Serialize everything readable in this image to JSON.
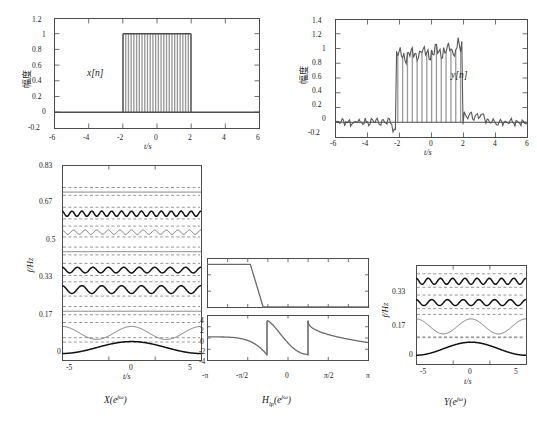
{
  "figure": {
    "background": "#ffffff",
    "line_color": "#4d4d4d",
    "dark_line_color": "#1a1a1a",
    "grid_color": "#808080"
  },
  "panels": {
    "top_left": {
      "name": "x[n] time-domain signal",
      "inner_label": "x[n]",
      "xlabel": "t/s",
      "ylabel": "幅度",
      "xticks": [
        "-6",
        "-4",
        "-2",
        "0",
        "2",
        "4",
        "6"
      ],
      "yticks": [
        "1.2",
        "1",
        "0.8",
        "0.6",
        "0.4",
        "0.2",
        "0",
        "-0.2"
      ],
      "xlim": [
        -6,
        6
      ],
      "ylim": [
        -0.2,
        1.2
      ]
    },
    "top_right": {
      "name": "y[n] time-domain signal",
      "inner_label": "y[n]",
      "xlabel": "t/s",
      "ylabel": "幅度",
      "xticks": [
        "-6",
        "-4",
        "-2",
        "0",
        "2",
        "4",
        "6"
      ],
      "yticks": [
        "1.4",
        "1.2",
        "1",
        "0.8",
        "0.6",
        "0.4",
        "0.2",
        "0",
        "-0.2"
      ],
      "xlim": [
        -6,
        6
      ],
      "ylim": [
        -0.2,
        1.4
      ]
    },
    "bottom_left": {
      "name": "X(e^jw) spectrogram waterfall",
      "caption": "X(eʲᵒ)",
      "caption_parts": {
        "base": "X(e",
        "sup": "jω",
        "close": ")"
      },
      "xlabel": "t/s",
      "ylabel": "f/Hz",
      "xticks": [
        "-5",
        "0",
        "5"
      ],
      "yticks": [
        "0.83",
        "0.67",
        "0.5",
        "0.33",
        "0.17",
        "0"
      ],
      "xlim": [
        -6,
        6
      ],
      "ylim": [
        0,
        0.9
      ]
    },
    "middle_mag": {
      "name": "Hlp magnitude response",
      "xticks": [],
      "ylim": [
        0,
        1.2
      ]
    },
    "middle_phase": {
      "name": "Hlp phase response",
      "caption": "H_lp(e^jw)",
      "caption_parts": {
        "base": "H",
        "sub": "lp",
        "mid": "(e",
        "sup": "jω",
        "close": ")"
      },
      "xticks": [
        "-π",
        "-π/2",
        "0",
        "π/2",
        "π"
      ],
      "yticks": [
        "4",
        "2",
        "0",
        "-2",
        "-4"
      ],
      "ylim": [
        -4,
        4
      ]
    },
    "bottom_right": {
      "name": "Y(e^jw) spectrogram waterfall",
      "caption": "Y(eʲᵒ)",
      "caption_parts": {
        "base": "Y(e",
        "sup": "jω",
        "close": ")"
      },
      "xlabel": "t/s",
      "ylabel": "f/Hz",
      "xticks": [
        "-5",
        "0",
        "5"
      ],
      "yticks": [
        "0.33",
        "0.17",
        "0"
      ],
      "ylabel_extra": "f/Hz",
      "xlim": [
        -6,
        6
      ],
      "ylim": [
        0,
        0.4
      ]
    }
  },
  "chart_data": [
    {
      "id": "top_left",
      "type": "bar",
      "title": "x[n]",
      "xlabel": "t/s",
      "ylabel": "幅度",
      "xlim": [
        -6,
        6
      ],
      "ylim": [
        -0.2,
        1.2
      ],
      "description": "Rectangular pulse of amplitude 1 between t=-2 and t=2, zero elsewhere, drawn as dense stem/bar samples",
      "pulse_start": -2,
      "pulse_end": 2,
      "pulse_amplitude": 1.0,
      "baseline": 0.0,
      "n_stems": 26
    },
    {
      "id": "top_right",
      "type": "bar",
      "title": "y[n]",
      "xlabel": "t/s",
      "ylabel": "幅度",
      "xlim": [
        -6,
        6
      ],
      "ylim": [
        -0.2,
        1.4
      ],
      "description": "Low-pass filtered pulse with Gibbs ripple; noisy small oscillation outside the pulse, ripple riding on a ~0.9-1.2 plateau inside",
      "pulse_start": -2.2,
      "pulse_end": 2.0,
      "plateau_mean": 1.0,
      "ripple_amplitude": 0.12,
      "outside_noise_amplitude": 0.07,
      "n_stems": 30,
      "values": [
        0.05,
        0.04,
        0.02,
        0.03,
        0.01,
        -0.01,
        0.0,
        -0.02,
        -0.05,
        -0.06,
        -0.04,
        -0.08,
        -0.12,
        0.85,
        0.93,
        0.86,
        0.9,
        0.95,
        0.88,
        0.92,
        0.97,
        0.93,
        0.99,
        1.02,
        0.98,
        1.05,
        1.01,
        1.08,
        1.04,
        1.1,
        1.06,
        1.15,
        1.18,
        0.2,
        0.08,
        0.05,
        0.1,
        0.06,
        0.09,
        0.04,
        0.02,
        -0.02,
        -0.04,
        -0.03,
        -0.06,
        -0.05,
        -0.07
      ]
    },
    {
      "id": "bottom_left",
      "type": "line",
      "title": "X(e^{jω})",
      "xlabel": "t/s",
      "ylabel": "f/Hz",
      "xlim": [
        -6,
        6
      ],
      "ylim": [
        0,
        0.9
      ],
      "grid": "dashed horizontal",
      "description": "Waterfall of short-time spectra: each trace is a frequency slice plotted versus time; ripple frequency increases with the slice index",
      "traces": [
        {
          "baseline": 0.03,
          "amplitude": 0.055,
          "cycles": 1.0,
          "weight": "bold"
        },
        {
          "baseline": 0.125,
          "amplitude": 0.03,
          "cycles": 2.0,
          "weight": "thin"
        },
        {
          "baseline": 0.225,
          "amplitude": 0.004,
          "cycles": 0.0,
          "weight": "thin"
        },
        {
          "baseline": 0.325,
          "amplitude": 0.018,
          "cycles": 7.0,
          "weight": "bold"
        },
        {
          "baseline": 0.415,
          "amplitude": 0.013,
          "cycles": 9.0,
          "weight": "bold"
        },
        {
          "baseline": 0.5,
          "amplitude": 0.003,
          "cycles": 0.0,
          "weight": "thin"
        },
        {
          "baseline": 0.59,
          "amplitude": 0.01,
          "cycles": 12.0,
          "weight": "thin"
        },
        {
          "baseline": 0.675,
          "amplitude": 0.012,
          "cycles": 14.0,
          "weight": "bold"
        },
        {
          "baseline": 0.775,
          "amplitude": 0.003,
          "cycles": 0.0,
          "weight": "thin"
        }
      ]
    },
    {
      "id": "middle_mag",
      "type": "line",
      "title": "|H_lp(e^{jω})| magnitude",
      "xlim": [
        -3.1416,
        3.1416
      ],
      "ylim": [
        0,
        1.15
      ],
      "description": "Ideal-ish low-pass magnitude: flat at 1 from -π up to about -0.45π, sharp transition, then 0 to π",
      "passband_edge": -1.45,
      "stopband_edge": -0.95,
      "passband_level": 1.0,
      "stopband_level": 0.0
    },
    {
      "id": "middle_phase",
      "type": "line",
      "title": "arg H_lp(e^{jω})",
      "xlabel": "ω",
      "xticks": [
        "-π",
        "-π/2",
        "0",
        "π/2",
        "π"
      ],
      "ylim": [
        -4,
        4
      ],
      "yticks": [
        -4,
        -2,
        0,
        2,
        4
      ],
      "description": "Phase with two 2π wrap discontinuities near ω = -0.8 and ω = +0.8, sawtooth-like branches decaying from +3 to -3"
    },
    {
      "id": "bottom_right",
      "type": "line",
      "title": "Y(e^{jω})",
      "xlabel": "t/s",
      "ylabel": "f/Hz",
      "xlim": [
        -6,
        6
      ],
      "ylim": [
        0,
        0.4
      ],
      "grid": "dashed horizontal",
      "description": "Waterfall of filtered spectra, only low-frequency slices survive",
      "traces": [
        {
          "baseline": 0.035,
          "amplitude": 0.052,
          "cycles": 1.0,
          "weight": "bold"
        },
        {
          "baseline": 0.15,
          "amplitude": 0.03,
          "cycles": 2.0,
          "weight": "thin"
        },
        {
          "baseline": 0.245,
          "amplitude": 0.012,
          "cycles": 7.0,
          "weight": "bold"
        },
        {
          "baseline": 0.33,
          "amplitude": 0.012,
          "cycles": 9.0,
          "weight": "bold"
        }
      ]
    }
  ]
}
